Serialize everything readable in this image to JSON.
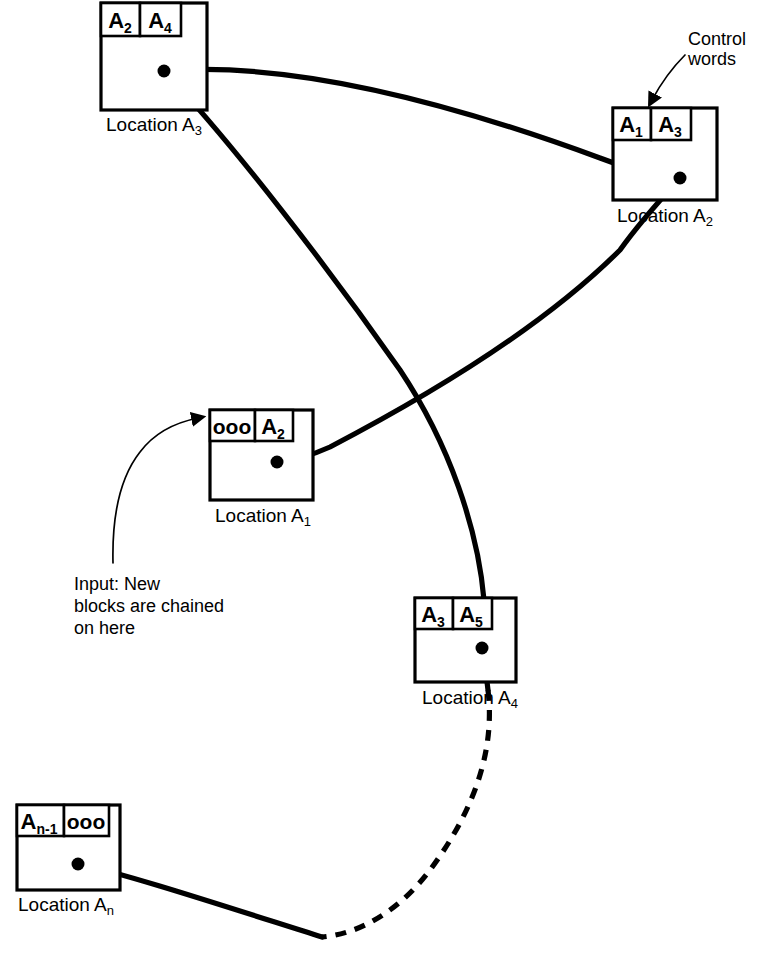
{
  "diagram": {
    "stroke_color": "#000000",
    "background_color": "#ffffff",
    "blocks": [
      {
        "id": "A3",
        "label": "Location A",
        "label_sub": "3",
        "cells": [
          {
            "text": "A",
            "sub": "2"
          },
          {
            "text": "A",
            "sub": "4"
          }
        ]
      },
      {
        "id": "A2",
        "label": "Location A",
        "label_sub": "2",
        "cells": [
          {
            "text": "A",
            "sub": "1"
          },
          {
            "text": "A",
            "sub": "3"
          }
        ]
      },
      {
        "id": "A1",
        "label": "Location A",
        "label_sub": "1",
        "cells": [
          {
            "text": "ooo",
            "sub": ""
          },
          {
            "text": "A",
            "sub": "2"
          }
        ]
      },
      {
        "id": "A4",
        "label": "Location A",
        "label_sub": "4",
        "cells": [
          {
            "text": "A",
            "sub": "3"
          },
          {
            "text": "A",
            "sub": "5"
          }
        ]
      },
      {
        "id": "An",
        "label": "Location A",
        "label_sub": "n",
        "cells": [
          {
            "text": "A",
            "sub": "n-1"
          },
          {
            "text": "ooo",
            "sub": ""
          }
        ]
      }
    ],
    "annotations": [
      {
        "id": "control-words",
        "lines": [
          "Control",
          "words"
        ]
      },
      {
        "id": "input-note",
        "lines": [
          "Input: New",
          "blocks are chained",
          "on here"
        ]
      }
    ]
  }
}
